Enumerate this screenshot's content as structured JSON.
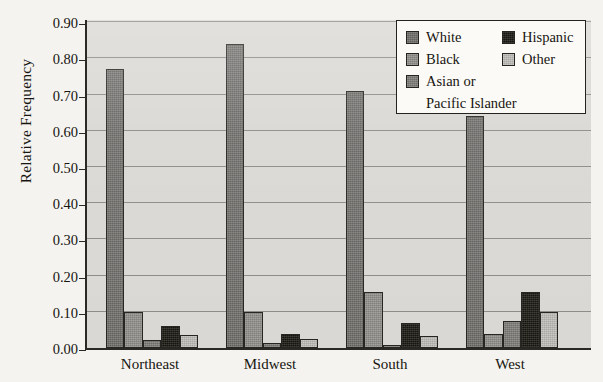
{
  "chart_data": {
    "type": "bar",
    "title": "",
    "xlabel": "",
    "ylabel": "Relative Frequency",
    "categories": [
      "Northeast",
      "Midwest",
      "South",
      "West"
    ],
    "series": [
      {
        "name": "White",
        "color": "#6e6d69",
        "values": [
          0.77,
          0.84,
          0.71,
          0.64
        ]
      },
      {
        "name": "Black",
        "color": "#8f8e8a",
        "values": [
          0.1,
          0.1,
          0.155,
          0.04
        ]
      },
      {
        "name": "Asian or\nPacific Islander",
        "color": "#7c7b77",
        "values": [
          0.022,
          0.015,
          0.008,
          0.075
        ]
      },
      {
        "name": "Hispanic",
        "color": "#17160f",
        "values": [
          0.06,
          0.04,
          0.07,
          0.155
        ]
      },
      {
        "name": "Other",
        "color": "#bebdb8",
        "values": [
          0.035,
          0.025,
          0.033,
          0.1
        ]
      }
    ],
    "ylim": [
      0.0,
      0.9
    ],
    "yticks": [
      "0.00",
      "0.10",
      "0.20",
      "0.30",
      "0.40",
      "0.50",
      "0.60",
      "0.70",
      "0.80",
      "0.90"
    ],
    "ytick_values": [
      0.0,
      0.1,
      0.2,
      0.3,
      0.4,
      0.5,
      0.6,
      0.7,
      0.8,
      0.9
    ],
    "grid": true,
    "legend_position": "top-right"
  },
  "legend": {
    "left_column": [
      {
        "label": "White",
        "swatch": "white-swatch",
        "color": "#6e6d69"
      },
      {
        "label": "Black",
        "swatch": "black-swatch",
        "color": "#8f8e8a"
      },
      {
        "label": "Asian or",
        "label_line2": "Pacific Islander",
        "swatch": "asian-swatch",
        "color": "#7c7b77"
      }
    ],
    "right_column": [
      {
        "label": "Hispanic",
        "swatch": "hispanic-swatch",
        "color": "#17160f"
      },
      {
        "label": "Other",
        "swatch": "other-swatch",
        "color": "#bebdb8"
      }
    ]
  },
  "axis": {
    "y_title": "Relative Frequency"
  }
}
